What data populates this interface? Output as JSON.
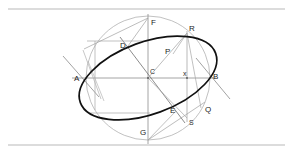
{
  "figure": {
    "title": "",
    "background_color": "#ffffff",
    "rule_color": "#b9b9b9",
    "construction_line_color": "#9a9a9a",
    "axis_line_color": "#8d8d8d",
    "ellipse_color": "#111111",
    "label_color": "#1d1d1d",
    "rules": [
      {
        "name": "top-rule",
        "y": 9
      },
      {
        "name": "bottom-rule",
        "y": 145
      }
    ],
    "center": {
      "label": "C",
      "x": 148,
      "y": 78
    },
    "circle": {
      "cx": 148,
      "cy": 78,
      "r": 62
    },
    "ellipse": {
      "cx": 148,
      "cy": 78,
      "rx": 72,
      "ry": 36,
      "rotation": -20
    },
    "points": [
      {
        "label": "A",
        "x": 78,
        "y": 78,
        "lx": 74,
        "ly": 81,
        "role": "major-axis-left"
      },
      {
        "label": "B",
        "x": 211,
        "y": 78,
        "lx": 213,
        "ly": 79,
        "role": "major-axis-right"
      },
      {
        "label": "C",
        "x": 148,
        "y": 78,
        "lx": 150,
        "ly": 74,
        "role": "center"
      },
      {
        "label": "D",
        "x": 128,
        "y": 46,
        "lx": 122,
        "ly": 48,
        "role": "conjugate-upper-left"
      },
      {
        "label": "E",
        "x": 176,
        "y": 111,
        "lx": 172,
        "ly": 112,
        "role": "conjugate-lower-right"
      },
      {
        "label": "F",
        "x": 148,
        "y": 18,
        "lx": 151,
        "ly": 24,
        "role": "circle-top"
      },
      {
        "label": "G",
        "x": 148,
        "y": 140,
        "lx": 142,
        "ly": 134,
        "role": "circle-bottom"
      },
      {
        "label": "P",
        "x": 173,
        "y": 54,
        "lx": 166,
        "ly": 53,
        "role": "ellipse-point"
      },
      {
        "label": "Q",
        "x": 201,
        "y": 108,
        "lx": 205,
        "ly": 111,
        "role": "ellipse-point"
      },
      {
        "label": "R",
        "x": 187,
        "y": 33,
        "lx": 190,
        "ly": 30,
        "role": "circle-point"
      },
      {
        "label": "S",
        "x": 187,
        "y": 118,
        "lx": 190,
        "ly": 124,
        "role": "circle-point"
      },
      {
        "label": "x",
        "x": 187,
        "y": 78,
        "lx": 185,
        "ly": 76,
        "role": "foot-of-ordinate"
      }
    ],
    "labels": [
      "A",
      "B",
      "C",
      "D",
      "E",
      "F",
      "G",
      "P",
      "Q",
      "R",
      "S",
      "x"
    ]
  }
}
